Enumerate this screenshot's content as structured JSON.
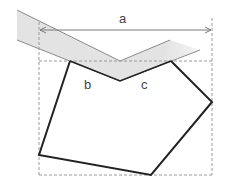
{
  "diagram": {
    "labels": {
      "a": "a",
      "b": "b",
      "c": "c"
    },
    "colors": {
      "band_fill": "#e6e6e6",
      "band_edge": "#8a8a8a",
      "dashed": "#9a9a9a",
      "polygon": "#222222",
      "arrow": "#7a7a7a"
    }
  }
}
